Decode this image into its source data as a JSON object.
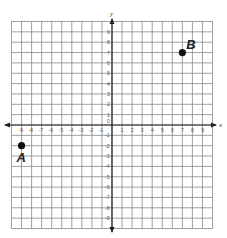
{
  "figure": {
    "x_axis_label": "x",
    "y_axis_label": "y",
    "origin_label": "0",
    "x_range": [
      -10,
      10
    ],
    "y_range": [
      -10,
      10
    ],
    "grid_color": "#888888",
    "axis_color": "#222222"
  },
  "x_ticks": [
    "-9",
    "-8",
    "-7",
    "-6",
    "-5",
    "-4",
    "-3",
    "-2",
    "-1",
    "1",
    "2",
    "3",
    "4",
    "5",
    "6",
    "7",
    "8",
    "9"
  ],
  "y_ticks": [
    "9",
    "8",
    "7",
    "6",
    "5",
    "4",
    "3",
    "2",
    "1",
    "-1",
    "-2",
    "-3",
    "-4",
    "-5",
    "-6",
    "-7",
    "-8",
    "-9"
  ],
  "points": [
    {
      "label": "A",
      "x": -9,
      "y": -2
    },
    {
      "label": "B",
      "x": 7,
      "y": 7
    }
  ]
}
